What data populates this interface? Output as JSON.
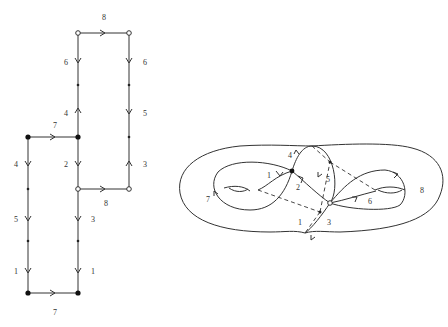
{
  "left_figure": {
    "description": "Polygon-like gluing diagram of edges with labels",
    "edge_labels": {
      "top": "8",
      "top_left_vertical": "6",
      "top_right_vertical": "6",
      "mid_left_upper": "4",
      "right_middle": "5",
      "horizontal_7_upper": "7",
      "left_upper": "4",
      "center_down": "2",
      "right_lower": "3",
      "horizontal_8_lower": "8",
      "left_middle": "5",
      "center_lower": "3",
      "left_bottom": "1",
      "center_bottom": "1",
      "bottom": "7"
    }
  },
  "right_figure": {
    "description": "Genus-2 surface with embedded graph",
    "edge_labels": {
      "e1": "1",
      "e2": "2",
      "e3": "3",
      "e4": "4",
      "e5": "5",
      "e6": "6",
      "e7": "7",
      "e8": "8",
      "dual": "1"
    }
  }
}
